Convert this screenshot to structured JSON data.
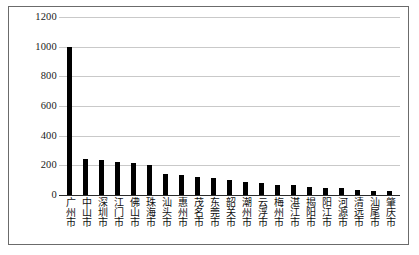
{
  "chart_data": {
    "type": "bar",
    "title": "",
    "xlabel": "",
    "ylabel": "",
    "ylim": [
      0,
      1200
    ],
    "yticks": [
      1200,
      1000,
      800,
      600,
      400,
      200,
      0
    ],
    "grid": true,
    "legend": "none",
    "bar_color": "#000000",
    "grid_color": "#c9c9c9",
    "categories": [
      "广州市",
      "中山市",
      "深圳市",
      "江门市",
      "佛山市",
      "珠海市",
      "汕头市",
      "惠州市",
      "茂名市",
      "东莞市",
      "韶关市",
      "潮州市",
      "云浮市",
      "梅州市",
      "湛江市",
      "揭阳市",
      "阳江市",
      "河源市",
      "清远市",
      "汕尾市",
      "肇庆市"
    ],
    "values": [
      1000,
      240,
      235,
      225,
      215,
      200,
      140,
      135,
      120,
      115,
      100,
      85,
      80,
      70,
      65,
      55,
      50,
      45,
      35,
      30,
      25
    ]
  }
}
